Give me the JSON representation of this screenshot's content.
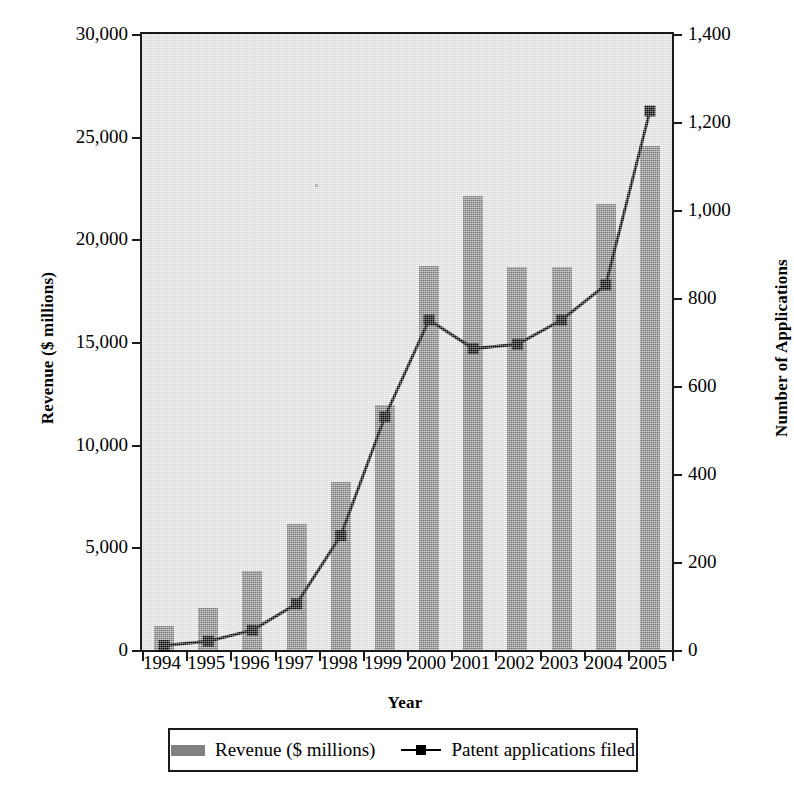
{
  "chart_data": {
    "type": "bar",
    "title": "",
    "xlabel": "Year",
    "ylabel": "Revenue ($ millions)",
    "ylabel_right": "Number of Applications",
    "categories": [
      "1994",
      "1995",
      "1996",
      "1997",
      "1998",
      "1999",
      "2000",
      "2001",
      "2002",
      "2003",
      "2004",
      "2005"
    ],
    "ylim": [
      0,
      30000
    ],
    "ylim_right": [
      0,
      1400
    ],
    "yticks": [
      "0",
      "5,000",
      "10,000",
      "15,000",
      "20,000",
      "25,000",
      "30,000"
    ],
    "ytick_values": [
      0,
      5000,
      10000,
      15000,
      20000,
      25000,
      30000
    ],
    "yticks_right": [
      "0",
      "200",
      "400",
      "600",
      "800",
      "1,000",
      "1,200",
      "1,400"
    ],
    "ytick_values_right": [
      0,
      200,
      400,
      600,
      800,
      1000,
      1200,
      1400
    ],
    "grid": false,
    "legend_position": "bottom",
    "series": [
      {
        "name": "Revenue ($ millions)",
        "kind": "bar",
        "axis": "left",
        "color": "#808080",
        "values": [
          1150,
          2050,
          3850,
          6150,
          8200,
          11950,
          18700,
          22100,
          18650,
          18650,
          21700,
          24550
        ]
      },
      {
        "name": "Patent applications filed",
        "kind": "line",
        "axis": "right",
        "color": "#000000",
        "marker": "square",
        "values": [
          10,
          20,
          45,
          105,
          260,
          530,
          750,
          685,
          695,
          750,
          830,
          1225
        ]
      }
    ]
  },
  "legend": {
    "entries": [
      {
        "label": "Revenue ($ millions)",
        "swatch": "bar-swatch"
      },
      {
        "label": "Patent applications filed",
        "swatch": "line-marker-swatch"
      }
    ]
  },
  "colors": {
    "bar_fill": "#808080",
    "line": "#000000",
    "plot_background": "#e2e2e2",
    "axis": "#1a1a1a"
  }
}
